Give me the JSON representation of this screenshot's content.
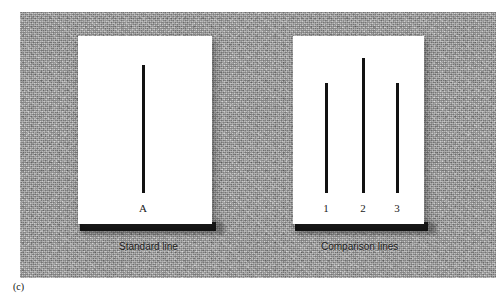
{
  "figure": {
    "panel_letter": "(c)",
    "background_color": "#ffffff",
    "backdrop_color": "#b2b2b2",
    "line_color": "#121212",
    "card_color": "#ffffff"
  },
  "standard_card": {
    "caption": "Standard line",
    "lines": [
      {
        "label": "A",
        "length_px": 128
      }
    ]
  },
  "comparison_card": {
    "caption": "Comparison lines",
    "lines": [
      {
        "label": "1",
        "length_px": 110
      },
      {
        "label": "2",
        "length_px": 135
      },
      {
        "label": "3",
        "length_px": 110
      }
    ]
  }
}
